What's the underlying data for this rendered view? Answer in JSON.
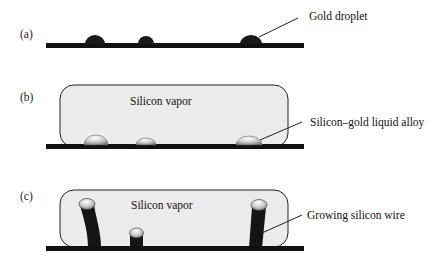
{
  "figure": {
    "panels": [
      {
        "id": "a",
        "label": "(a)",
        "annotation": "Gold droplet"
      },
      {
        "id": "b",
        "label": "(b)",
        "vapor_label": "Silicon vapor",
        "annotation": "Silicon–gold liquid alloy"
      },
      {
        "id": "c",
        "label": "(c)",
        "vapor_label": "Silicon vapor",
        "annotation": "Growing silicon wire"
      }
    ],
    "colors": {
      "substrate": "#111111",
      "vapor_fill": "#ebebeb",
      "vapor_stroke": "#222222",
      "gold_droplet": "#1a1a1a",
      "alloy_light": "#f2f2f2",
      "alloy_dark": "#8a8a8a"
    }
  }
}
